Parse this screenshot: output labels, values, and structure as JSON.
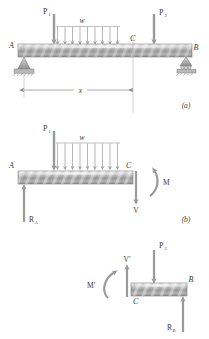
{
  "figure": {
    "title_parts": [
      "(a)",
      "(b)"
    ],
    "panels": [
      {
        "id": "a",
        "caption": "(a)",
        "labels": {
          "support_left": "A",
          "support_right": "B",
          "section_point": "C",
          "point_load_left": "P",
          "point_load_left_sub": "1",
          "point_load_right": "P",
          "point_load_right_sub": "2",
          "distributed_load": "w",
          "dimension": "x"
        },
        "icons": {
          "pin_support": "pin-support-icon",
          "roller_support": "roller-support-icon",
          "down_arrow": "down-arrow-icon",
          "dimension_arrow": "dimension-arrow-icon"
        },
        "distributed_load_arrow_count": 9
      },
      {
        "id": "b",
        "caption": "(b)",
        "labels": {
          "left_end": "A",
          "cut_point": "C",
          "point_load_left": "P",
          "point_load_left_sub": "1",
          "distributed_load": "w",
          "shear": "V",
          "moment": "M",
          "reaction_left": "R",
          "reaction_left_sub": "A"
        },
        "icons": {
          "down_arrow": "down-arrow-icon",
          "up_arrow": "up-arrow-icon",
          "moment_curved_arrow": "curved-moment-arrow-icon"
        },
        "distributed_load_arrow_count": 9
      },
      {
        "id": "c",
        "caption": "",
        "labels": {
          "cut_point": "C",
          "right_end": "B",
          "point_load_right": "P",
          "point_load_right_sub": "2",
          "shear": "V'",
          "moment": "M'",
          "reaction_right": "R",
          "reaction_right_sub": "B"
        },
        "icons": {
          "down_arrow": "down-arrow-icon",
          "up_arrow": "up-arrow-icon",
          "moment_curved_arrow": "curved-moment-arrow-icon"
        }
      }
    ],
    "colors": {
      "beam_light": "#e8e8e8",
      "beam_mid": "#a8a8a8",
      "beam_dark": "#8d8d8d",
      "outline": "#6f6f6f",
      "arrow": "#9a9a9a",
      "text": "#3b3b3b",
      "thin_line": "#b4b4b4",
      "background": "#ffffff"
    }
  }
}
